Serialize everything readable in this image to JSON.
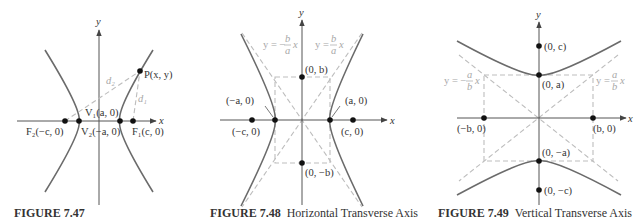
{
  "figures": [
    {
      "id": "fig-7-47",
      "caption_number": "FIGURE 7.47",
      "caption_text": "",
      "axis_labels": {
        "x": "x",
        "y": "y"
      },
      "points": {
        "P": "P(x, y)",
        "V1": "V₁(a, 0)",
        "V2": "V₂(−a, 0)",
        "F1": "F₁(c, 0)",
        "F2": "F₂(−c, 0)"
      },
      "distances": {
        "d1": "d₁",
        "d2": "d₂"
      }
    },
    {
      "id": "fig-7-48",
      "caption_number": "FIGURE 7.48",
      "caption_text": "Horizontal Transverse Axis",
      "axis_labels": {
        "x": "x",
        "y": "y"
      },
      "asymptotes": {
        "left": "y = −(b/a) x",
        "right": "y = (b/a) x"
      },
      "asymptote_parts": {
        "left_prefix": "y = −",
        "right_prefix": "y = ",
        "num": "b",
        "den": "a",
        "var": "x"
      },
      "points": {
        "b_top": "(0, b)",
        "b_bottom": "(0, −b)",
        "a_left": "(−a, 0)",
        "a_right": "(a, 0)",
        "c_left": "(−c, 0)",
        "c_right": "(c, 0)"
      }
    },
    {
      "id": "fig-7-49",
      "caption_number": "FIGURE 7.49",
      "caption_text": "Vertical Transverse Axis",
      "axis_labels": {
        "x": "x",
        "y": "y"
      },
      "asymptotes": {
        "left": "y = −(a/b) x",
        "right": "y = (a/b) x"
      },
      "asymptote_parts": {
        "left_prefix": "y = −",
        "right_prefix": "y = ",
        "num": "a",
        "den": "b",
        "var": "x"
      },
      "points": {
        "c_top": "(0, c)",
        "a_top": "(0, a)",
        "a_bottom": "(0, −a)",
        "c_bottom": "(0, −c)",
        "b_left": "(−b, 0)",
        "b_right": "(b, 0)"
      }
    }
  ]
}
